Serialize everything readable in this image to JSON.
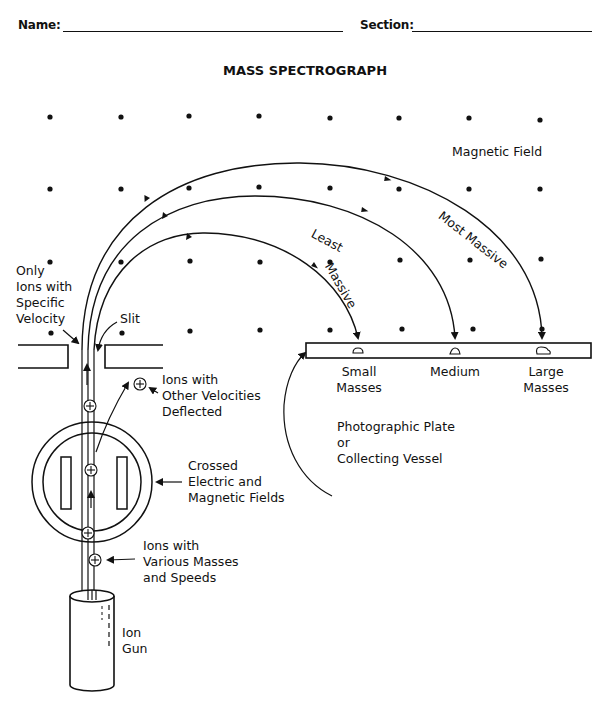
{
  "header": {
    "name_label": "Name:",
    "section_label": "Section:"
  },
  "title": "MASS SPECTROGRAPH",
  "labels": {
    "magnetic_field": "Magnetic Field",
    "most_massive": "Most Massive",
    "least": "Least",
    "massive": "Massive",
    "only_ions": [
      "Only",
      "Ions with",
      "Specific",
      "Velocity"
    ],
    "slit": "Slit",
    "other_velocities": [
      "Ions with",
      "Other Velocities",
      "Deflected"
    ],
    "crossed_fields": [
      "Crossed",
      "Electric and",
      "Magnetic Fields"
    ],
    "various_masses": [
      "Ions with",
      "Various Masses",
      "and Speeds"
    ],
    "ion_gun": [
      "Ion",
      "Gun"
    ],
    "small_masses": [
      "Small",
      "Masses"
    ],
    "medium": "Medium",
    "large_masses": [
      "Large",
      "Masses"
    ],
    "plate": [
      "Photographic Plate",
      "or",
      "Collecting Vessel"
    ]
  },
  "colors": {
    "ink": "#111111",
    "paper": "#ffffff"
  }
}
